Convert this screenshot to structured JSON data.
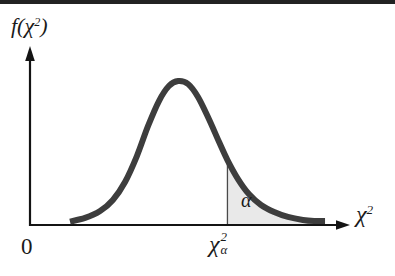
{
  "labels": {
    "y_axis": {
      "prefix": "f(",
      "chi": "χ",
      "sup": "2",
      "suffix": ")"
    },
    "x_axis": {
      "chi": "χ",
      "sup": "2"
    },
    "critical": {
      "chi": "χ",
      "sup": "2",
      "sub": "α"
    },
    "alpha": "α",
    "origin": "0"
  },
  "chart_data": {
    "type": "area",
    "title": "",
    "xlabel": "χ2",
    "ylabel": "f(χ2)",
    "x_tick_labels": [
      "0",
      "χα2"
    ],
    "annotations": [
      "α"
    ],
    "legend": "none",
    "grid": false,
    "critical_x_normalized": 0.617,
    "curve_points_normalized": [
      [
        0.125,
        0.024
      ],
      [
        0.172,
        0.049
      ],
      [
        0.219,
        0.097
      ],
      [
        0.259,
        0.174
      ],
      [
        0.297,
        0.299
      ],
      [
        0.334,
        0.479
      ],
      [
        0.369,
        0.688
      ],
      [
        0.403,
        0.861
      ],
      [
        0.434,
        0.965
      ],
      [
        0.463,
        1.0
      ],
      [
        0.494,
        0.979
      ],
      [
        0.525,
        0.889
      ],
      [
        0.559,
        0.736
      ],
      [
        0.591,
        0.576
      ],
      [
        0.617,
        0.451
      ],
      [
        0.65,
        0.319
      ],
      [
        0.684,
        0.215
      ],
      [
        0.722,
        0.139
      ],
      [
        0.763,
        0.09
      ],
      [
        0.806,
        0.056
      ],
      [
        0.853,
        0.035
      ],
      [
        0.888,
        0.028
      ],
      [
        0.922,
        0.028
      ]
    ],
    "colors": {
      "curve": "#3d3d3d",
      "shade": "#e9e9e9",
      "axis": "#141414",
      "critical_line": "#4a4a4a",
      "top_rule": "#222222",
      "background": "#ffffff"
    }
  }
}
